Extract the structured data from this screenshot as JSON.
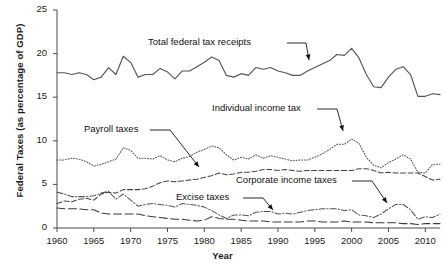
{
  "chart_data": {
    "type": "line",
    "title": "",
    "xlabel": "Year",
    "ylabel": "Federal Taxes (as percentage of GDP)",
    "xlim": [
      1960,
      2012
    ],
    "ylim": [
      0,
      25
    ],
    "xticks": [
      "1960",
      "1965",
      "1970",
      "1975",
      "1980",
      "1985",
      "1990",
      "1995",
      "2000",
      "2005",
      "2010"
    ],
    "yticks": [
      "0",
      "5",
      "10",
      "15",
      "20",
      "25"
    ],
    "grid": false,
    "legend_position": "inline-annotations",
    "x": [
      1960,
      1961,
      1962,
      1963,
      1964,
      1965,
      1966,
      1967,
      1968,
      1969,
      1970,
      1971,
      1972,
      1973,
      1974,
      1975,
      1976,
      1977,
      1978,
      1979,
      1980,
      1981,
      1982,
      1983,
      1984,
      1985,
      1986,
      1987,
      1988,
      1989,
      1990,
      1991,
      1992,
      1993,
      1994,
      1995,
      1996,
      1997,
      1998,
      1999,
      2000,
      2001,
      2002,
      2003,
      2004,
      2005,
      2006,
      2007,
      2008,
      2009,
      2010,
      2011,
      2012
    ],
    "series": [
      {
        "name": "Total federal tax receipts",
        "style": "solid",
        "color": "#555555",
        "values": [
          17.8,
          17.8,
          17.6,
          17.8,
          17.6,
          17.0,
          17.3,
          18.4,
          17.6,
          19.7,
          19.0,
          17.3,
          17.6,
          17.6,
          18.3,
          17.9,
          17.1,
          18.0,
          18.0,
          18.5,
          19.0,
          19.6,
          19.2,
          17.5,
          17.3,
          17.7,
          17.5,
          18.4,
          18.2,
          18.4,
          18.0,
          17.8,
          17.5,
          17.5,
          18.0,
          18.4,
          18.8,
          19.2,
          19.9,
          19.8,
          20.6,
          19.5,
          17.6,
          16.2,
          16.1,
          17.3,
          18.2,
          18.5,
          17.6,
          15.1,
          15.1,
          15.4,
          15.3
        ]
      },
      {
        "name": "Individual income tax",
        "style": "dotted",
        "color": "#555555",
        "values": [
          7.8,
          7.8,
          8.0,
          7.9,
          7.6,
          7.1,
          7.3,
          7.6,
          7.9,
          9.2,
          8.9,
          8.0,
          8.0,
          7.9,
          8.3,
          7.8,
          7.6,
          8.0,
          8.2,
          8.7,
          9.0,
          9.4,
          9.2,
          8.4,
          7.8,
          8.1,
          7.9,
          8.4,
          8.0,
          8.3,
          8.1,
          7.9,
          7.7,
          7.8,
          7.8,
          8.1,
          8.5,
          9.0,
          9.6,
          9.6,
          10.2,
          9.7,
          8.1,
          7.2,
          6.9,
          7.5,
          7.9,
          8.4,
          7.9,
          6.4,
          6.3,
          7.3,
          7.3
        ]
      },
      {
        "name": "Payroll taxes",
        "style": "dashed",
        "color": "#444444",
        "values": [
          2.8,
          3.1,
          3.0,
          3.3,
          3.4,
          3.2,
          3.9,
          4.1,
          4.0,
          4.4,
          4.4,
          4.4,
          4.5,
          4.8,
          5.2,
          5.4,
          5.3,
          5.4,
          5.5,
          5.6,
          5.8,
          6.0,
          6.3,
          6.1,
          6.2,
          6.4,
          6.4,
          6.5,
          6.7,
          6.7,
          6.6,
          6.7,
          6.6,
          6.5,
          6.6,
          6.6,
          6.6,
          6.6,
          6.6,
          6.6,
          6.6,
          6.8,
          6.8,
          6.6,
          6.3,
          6.4,
          6.3,
          6.3,
          6.3,
          6.3,
          5.9,
          5.5,
          5.6
        ]
      },
      {
        "name": "Corporate income taxes",
        "style": "dash-dot",
        "color": "#555555",
        "values": [
          4.1,
          3.9,
          3.6,
          3.6,
          3.6,
          3.7,
          4.0,
          4.2,
          3.3,
          3.9,
          3.2,
          2.5,
          2.7,
          2.8,
          2.7,
          2.6,
          2.4,
          2.8,
          2.7,
          2.6,
          2.4,
          2.0,
          1.5,
          1.1,
          1.5,
          1.5,
          1.4,
          1.8,
          1.9,
          1.9,
          1.6,
          1.7,
          1.6,
          1.8,
          2.0,
          2.1,
          2.2,
          2.2,
          2.2,
          2.0,
          2.1,
          1.5,
          1.4,
          1.2,
          1.6,
          2.2,
          2.7,
          2.7,
          2.1,
          1.0,
          1.3,
          1.2,
          1.6
        ]
      },
      {
        "name": "Excise taxes",
        "style": "long-dash",
        "color": "#3a3a3a",
        "values": [
          2.3,
          2.2,
          2.2,
          2.2,
          2.1,
          2.1,
          1.7,
          1.6,
          1.6,
          1.6,
          1.6,
          1.6,
          1.4,
          1.3,
          1.2,
          1.1,
          1.0,
          1.0,
          0.9,
          0.8,
          0.9,
          1.3,
          1.1,
          1.0,
          1.0,
          0.9,
          0.8,
          0.8,
          0.8,
          0.7,
          0.7,
          0.7,
          0.7,
          0.7,
          0.8,
          0.8,
          0.7,
          0.7,
          0.7,
          0.8,
          0.7,
          0.7,
          0.7,
          0.6,
          0.6,
          0.6,
          0.6,
          0.5,
          0.5,
          0.4,
          0.5,
          0.5,
          0.5
        ]
      }
    ],
    "annotations": [
      {
        "text": "Total federal tax receipts",
        "series": "Total federal tax receipts"
      },
      {
        "text": "Individual income tax",
        "series": "Individual income tax"
      },
      {
        "text": "Payroll taxes",
        "series": "Payroll taxes"
      },
      {
        "text": "Corporate income taxes",
        "series": "Corporate income taxes"
      },
      {
        "text": "Excise taxes",
        "series": "Excise taxes"
      }
    ]
  }
}
